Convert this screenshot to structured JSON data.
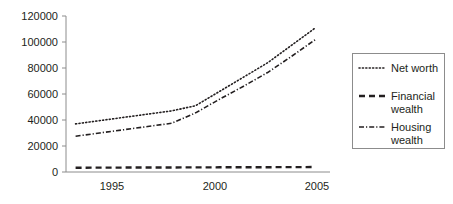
{
  "chart_data": {
    "type": "line",
    "title": "",
    "subtitle": "",
    "xlabel": "",
    "ylabel": "",
    "x": [
      1995,
      1996,
      1997,
      1998,
      1999,
      2000,
      2001,
      2002,
      2003,
      2004,
      2005
    ],
    "xlim": [
      1994.6,
      2005.6
    ],
    "ylim": [
      0,
      120000
    ],
    "grid": false,
    "legend_position": "right",
    "y_ticks": [
      0,
      20000,
      40000,
      60000,
      80000,
      100000,
      120000
    ],
    "y_tick_labels": [
      "0",
      "20000",
      "40000",
      "60000",
      "80000",
      "100000",
      "120000"
    ],
    "x_ticks": [
      1995,
      2000,
      2005
    ],
    "x_tick_labels": [
      "1995",
      "2000",
      "2005"
    ],
    "series": [
      {
        "name": "Net worth",
        "style": "dotted",
        "values": [
          37000,
          39500,
          42000,
          44500,
          47000,
          51000,
          62000,
          73000,
          84000,
          97500,
          111000
        ]
      },
      {
        "name": "Financial wealth",
        "style": "dashed",
        "values": [
          3300,
          3350,
          3400,
          3450,
          3500,
          3550,
          3600,
          3650,
          3700,
          3750,
          3800
        ]
      },
      {
        "name": "Housing wealth",
        "style": "dash-dot",
        "values": [
          27500,
          30000,
          32500,
          35000,
          37500,
          45500,
          56000,
          66000,
          76500,
          89000,
          102000
        ]
      }
    ],
    "colors": {
      "series_stroke": "#231f20",
      "axis": "#8c8c8c",
      "legend_frame": "#8c8c8c",
      "background": "#ffffff"
    }
  },
  "legend": {
    "entries": [
      {
        "label_line1": "Net worth",
        "label_line2": ""
      },
      {
        "label_line1": "Financial",
        "label_line2": "wealth"
      },
      {
        "label_line1": "Housing",
        "label_line2": "wealth"
      }
    ]
  }
}
